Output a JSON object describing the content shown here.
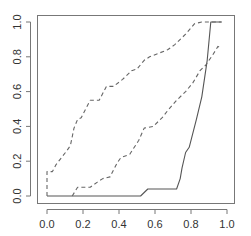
{
  "chart_data": {
    "type": "line",
    "title": "",
    "xlabel": "",
    "ylabel": "",
    "xlim": [
      0.0,
      1.0
    ],
    "ylim": [
      0.0,
      1.0
    ],
    "grid": false,
    "legend": null,
    "x_ticks": [
      "0.0",
      "0.2",
      "0.4",
      "0.6",
      "0.8",
      "1.0"
    ],
    "y_ticks": [
      "0.0",
      "0.2",
      "0.4",
      "0.6",
      "0.8",
      "1.0"
    ],
    "series": [
      {
        "name": "estimate",
        "style": "solid",
        "color": "#555555",
        "points": [
          [
            0.0,
            0.0
          ],
          [
            0.52,
            0.0
          ],
          [
            0.56,
            0.04
          ],
          [
            0.72,
            0.04
          ],
          [
            0.74,
            0.1
          ],
          [
            0.75,
            0.16
          ],
          [
            0.77,
            0.25
          ],
          [
            0.79,
            0.28
          ],
          [
            0.83,
            0.44
          ],
          [
            0.86,
            0.57
          ],
          [
            0.89,
            0.78
          ],
          [
            0.91,
            1.0
          ],
          [
            0.97,
            1.0
          ]
        ]
      },
      {
        "name": "upper bound",
        "style": "dashed",
        "color": "#666666",
        "points": [
          [
            0.0,
            0.0
          ],
          [
            0.0,
            0.14
          ],
          [
            0.03,
            0.14
          ],
          [
            0.05,
            0.18
          ],
          [
            0.11,
            0.26
          ],
          [
            0.13,
            0.29
          ],
          [
            0.15,
            0.39
          ],
          [
            0.17,
            0.44
          ],
          [
            0.19,
            0.45
          ],
          [
            0.23,
            0.53
          ],
          [
            0.24,
            0.55
          ],
          [
            0.29,
            0.55
          ],
          [
            0.33,
            0.63
          ],
          [
            0.37,
            0.63
          ],
          [
            0.42,
            0.67
          ],
          [
            0.47,
            0.72
          ],
          [
            0.5,
            0.73
          ],
          [
            0.54,
            0.78
          ],
          [
            0.57,
            0.8
          ],
          [
            0.62,
            0.82
          ],
          [
            0.67,
            0.84
          ],
          [
            0.71,
            0.87
          ],
          [
            0.77,
            0.93
          ],
          [
            0.82,
            0.99
          ],
          [
            0.86,
            1.0
          ],
          [
            0.97,
            1.0
          ]
        ]
      },
      {
        "name": "lower bound",
        "style": "dashed",
        "color": "#666666",
        "points": [
          [
            0.14,
            0.0
          ],
          [
            0.17,
            0.05
          ],
          [
            0.24,
            0.05
          ],
          [
            0.28,
            0.08
          ],
          [
            0.31,
            0.1
          ],
          [
            0.35,
            0.11
          ],
          [
            0.39,
            0.19
          ],
          [
            0.41,
            0.22
          ],
          [
            0.46,
            0.24
          ],
          [
            0.51,
            0.32
          ],
          [
            0.54,
            0.39
          ],
          [
            0.59,
            0.4
          ],
          [
            0.64,
            0.45
          ],
          [
            0.67,
            0.49
          ],
          [
            0.72,
            0.55
          ],
          [
            0.77,
            0.6
          ],
          [
            0.81,
            0.65
          ],
          [
            0.85,
            0.72
          ],
          [
            0.88,
            0.75
          ],
          [
            0.92,
            0.81
          ],
          [
            0.95,
            0.86
          ],
          [
            0.97,
            0.85
          ]
        ]
      }
    ]
  },
  "layout": {
    "plot_box": {
      "left": 37,
      "top": 15,
      "right": 234,
      "bottom": 203
    },
    "x_map": {
      "origin_px": 47,
      "scale_px": 180
    },
    "y_map": {
      "origin_px": 196,
      "scale_px": 174
    },
    "axis_color": "#777777"
  }
}
